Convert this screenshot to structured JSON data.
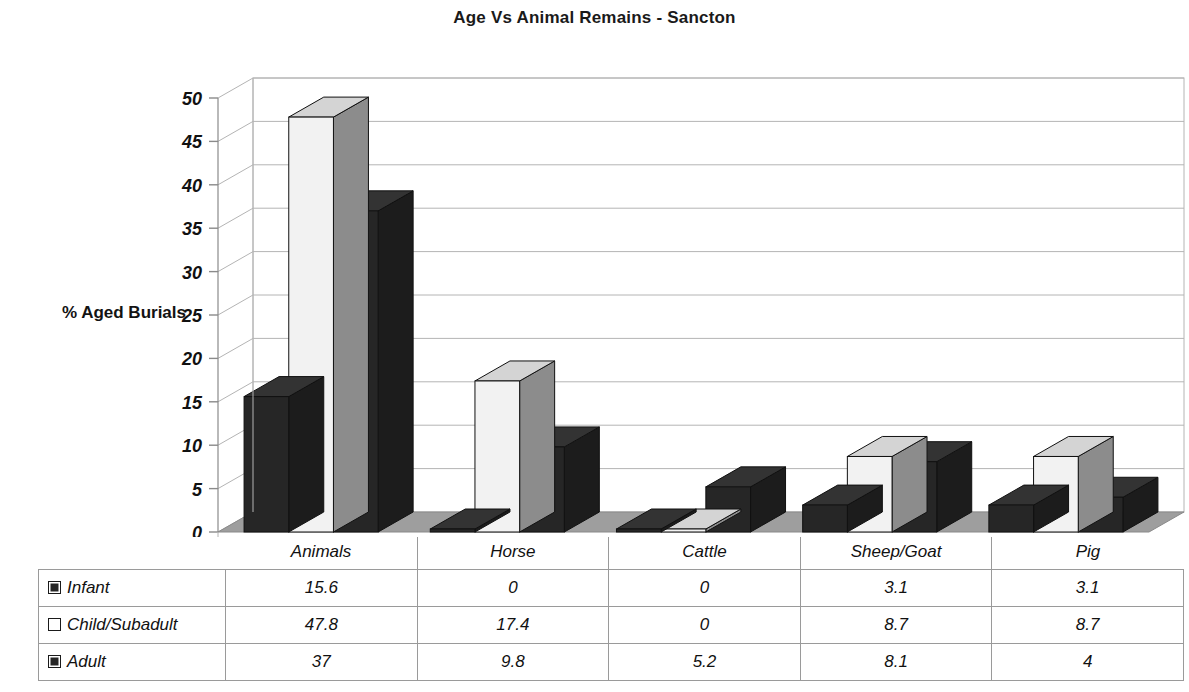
{
  "chart_data": {
    "type": "bar",
    "title": "Age Vs Animal Remains - Sancton",
    "xlabel": "",
    "ylabel": "% Aged Burials",
    "categories": [
      "Animals",
      "Horse",
      "Cattle",
      "Sheep/Goat",
      "Pig"
    ],
    "series": [
      {
        "name": "Infant",
        "values": [
          15.6,
          0,
          0,
          3.1,
          3.1
        ],
        "color": "#262626",
        "swatch": "dark"
      },
      {
        "name": "Child/Subadult",
        "values": [
          47.8,
          17.4,
          0,
          8.7,
          8.7
        ],
        "color": "#f2f2f2",
        "swatch": "light"
      },
      {
        "name": "Adult",
        "values": [
          37,
          9.8,
          5.2,
          8.1,
          4
        ],
        "color": "#262626",
        "swatch": "dark"
      }
    ],
    "value_labels": [
      [
        "15.6",
        "0",
        "0",
        "3.1",
        "3.1"
      ],
      [
        "47.8",
        "17.4",
        "0",
        "8.7",
        "8.7"
      ],
      [
        "37",
        "9.8",
        "5.2",
        "8.1",
        "4"
      ]
    ],
    "ylim": [
      0,
      50
    ],
    "ytick_values": [
      0,
      5,
      10,
      15,
      20,
      25,
      30,
      35,
      40,
      45,
      50
    ],
    "ytick_labels": [
      "0",
      "5",
      "10",
      "15",
      "20",
      "25",
      "30",
      "35",
      "40",
      "45",
      "50"
    ],
    "grid": true,
    "legend_position": "data-table-left",
    "three_d": true
  },
  "table": {
    "row_labels": [
      "Infant",
      "Child/Subadult",
      "Adult"
    ],
    "column_headers": [
      "Animals",
      "Horse",
      "Cattle",
      "Sheep/Goat",
      "Pig"
    ],
    "rows": [
      {
        "label": "Infant",
        "swatch": "dark",
        "cells": [
          "15.6",
          "0",
          "0",
          "3.1",
          "3.1"
        ]
      },
      {
        "label": "Child/Subadult",
        "swatch": "light",
        "cells": [
          "47.8",
          "17.4",
          "0",
          "8.7",
          "8.7"
        ]
      },
      {
        "label": "Adult",
        "swatch": "dark",
        "cells": [
          "37",
          "9.8",
          "5.2",
          "8.1",
          "4"
        ]
      }
    ]
  },
  "colors": {
    "bar_dark": "#262626",
    "bar_dark_side": "#1c1c1c",
    "bar_dark_top": "#333333",
    "bar_light": "#f2f2f2",
    "bar_light_side": "#8c8c8c",
    "bar_light_top": "#d4d4d4",
    "floor": "#9e9e9e",
    "gridline": "#b4b4b4",
    "axis": "#8a8a8a",
    "text": "#111111"
  }
}
